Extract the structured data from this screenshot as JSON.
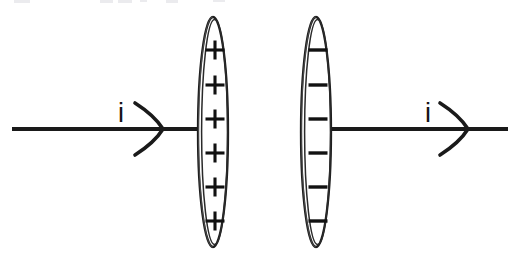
{
  "figure": {
    "title": "Parallel capacitor plates with conduction current",
    "background_color": "#ffffff",
    "ink_color": "#1a1a1a",
    "width": 519,
    "height": 260
  },
  "wires": [
    {
      "id": "left-wire",
      "name": "incoming-current-wire",
      "x_start": 12,
      "x_end": 202,
      "y": 129,
      "direction": "right"
    },
    {
      "id": "right-wire",
      "name": "outgoing-current-wire",
      "x_start": 317,
      "x_end": 508,
      "y": 129,
      "direction": "right"
    }
  ],
  "arrows": [
    {
      "id": "left-arrow",
      "name": "left-current-arrowhead",
      "tip_x": 163,
      "y": 129,
      "style": "open-chevron",
      "direction": "right"
    },
    {
      "id": "right-arrow",
      "name": "right-current-arrowhead",
      "tip_x": 468,
      "y": 129,
      "style": "open-chevron",
      "direction": "right"
    }
  ],
  "labels": [
    {
      "id": "left-current-label",
      "name": "current-label-left",
      "text": "i",
      "x": 121,
      "y": 122,
      "meaning": "current"
    },
    {
      "id": "right-current-label",
      "name": "current-label-right",
      "text": "i",
      "x": 428,
      "y": 122,
      "meaning": "current"
    }
  ],
  "plates": [
    {
      "id": "positive-plate",
      "name": "positive-capacitor-plate",
      "center_x": 213,
      "center_y": 132,
      "radius_x": 15,
      "radius_y": 115,
      "charge_sign": "+",
      "charge_label": "positive",
      "charge_count": 6,
      "charges": [
        "+",
        "+",
        "+",
        "+",
        "+",
        "+"
      ],
      "charge_y_positions": [
        50,
        85,
        119,
        153,
        187,
        221
      ]
    },
    {
      "id": "negative-plate",
      "name": "negative-capacitor-plate",
      "center_x": 316,
      "center_y": 132,
      "radius_x": 15,
      "radius_y": 115,
      "charge_sign": "−",
      "charge_label": "negative",
      "charge_count": 6,
      "charges": [
        "−",
        "−",
        "−",
        "−",
        "−",
        "−"
      ],
      "charge_y_positions": [
        50,
        85,
        119,
        153,
        187,
        221
      ]
    }
  ],
  "crop_artifacts": {
    "name": "cropped-text-remnants",
    "description": "Faint gray remnants of a clipped line of text along the very top edge of the scan",
    "color": "#e9e9ec",
    "marks": [
      {
        "x": 14,
        "y": 0,
        "w": 16,
        "h": 3
      },
      {
        "x": 100,
        "y": 0,
        "w": 13,
        "h": 3
      },
      {
        "x": 118,
        "y": 0,
        "w": 14,
        "h": 3
      },
      {
        "x": 140,
        "y": 0,
        "w": 7,
        "h": 2
      },
      {
        "x": 166,
        "y": 0,
        "w": 12,
        "h": 3
      },
      {
        "x": 213,
        "y": 0,
        "w": 12,
        "h": 2
      }
    ]
  }
}
